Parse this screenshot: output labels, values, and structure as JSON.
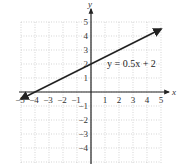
{
  "chart_data": {
    "type": "line",
    "title": "",
    "xlabel": "x",
    "ylabel": "y",
    "xlim": [
      -5,
      5
    ],
    "ylim": [
      -5,
      5
    ],
    "grid": true,
    "x_ticks": [
      "-5",
      "-4",
      "-3",
      "-2",
      "-1",
      "1",
      "2",
      "3",
      "4",
      "5"
    ],
    "y_ticks": [
      "5",
      "4",
      "3",
      "2",
      "1",
      "-1",
      "-2",
      "-3",
      "-4"
    ],
    "series": [
      {
        "name": "y = 0.5x + 2",
        "equation": "y = 0.5x + 2",
        "slope": 0.5,
        "intercept": 2,
        "x": [
          -5,
          5
        ],
        "y": [
          -0.5,
          4.5
        ],
        "arrows": "both"
      }
    ],
    "annotations": [
      {
        "text": "y = 0.5x + 2",
        "x": 1,
        "y": 2
      }
    ]
  },
  "colors": {
    "line": "#222222",
    "axis": "#222222",
    "grid": "#bbbbbb",
    "background": "#ffffff"
  }
}
